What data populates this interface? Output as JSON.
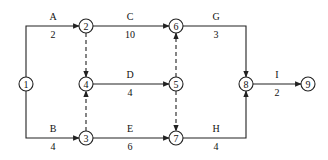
{
  "diagram": {
    "type": "activity-on-arrow network",
    "nodes": [
      {
        "id": "1",
        "label": "1",
        "x": 26,
        "y": 84
      },
      {
        "id": "2",
        "label": "2",
        "x": 86,
        "y": 26
      },
      {
        "id": "3",
        "label": "3",
        "x": 86,
        "y": 138
      },
      {
        "id": "4",
        "label": "4",
        "x": 86,
        "y": 84
      },
      {
        "id": "5",
        "label": "5",
        "x": 176,
        "y": 84
      },
      {
        "id": "6",
        "label": "6",
        "x": 176,
        "y": 26
      },
      {
        "id": "7",
        "label": "7",
        "x": 176,
        "y": 138
      },
      {
        "id": "8",
        "label": "8",
        "x": 246,
        "y": 84
      },
      {
        "id": "9",
        "label": "9",
        "x": 308,
        "y": 84
      }
    ],
    "activities": [
      {
        "name": "A",
        "duration": "2",
        "from": "1",
        "to": "2"
      },
      {
        "name": "B",
        "duration": "4",
        "from": "1",
        "to": "3"
      },
      {
        "name": "C",
        "duration": "10",
        "from": "2",
        "to": "6"
      },
      {
        "name": "D",
        "duration": "4",
        "from": "4",
        "to": "5"
      },
      {
        "name": "E",
        "duration": "6",
        "from": "3",
        "to": "7"
      },
      {
        "name": "G",
        "duration": "3",
        "from": "6",
        "to": "8"
      },
      {
        "name": "H",
        "duration": "4",
        "from": "7",
        "to": "8"
      },
      {
        "name": "I",
        "duration": "2",
        "from": "8",
        "to": "9"
      }
    ],
    "dummy_activities": [
      {
        "from": "2",
        "to": "4"
      },
      {
        "from": "3",
        "to": "4"
      },
      {
        "from": "5",
        "to": "6"
      },
      {
        "from": "5",
        "to": "7"
      }
    ]
  }
}
